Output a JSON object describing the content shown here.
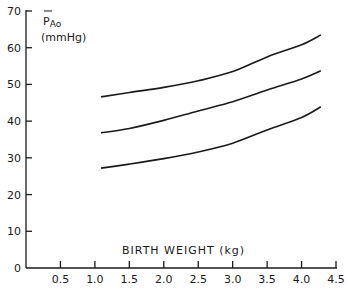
{
  "chart_data": {
    "type": "line",
    "title": "",
    "xlabel": "BIRTH WEIGHT (kg)",
    "ylabel": "P̄Ao (mmHg)",
    "ylabel_main": "P",
    "ylabel_sub": "Ao",
    "ylabel_units": "(mmHg)",
    "xlim": [
      0,
      4.5
    ],
    "ylim": [
      0,
      70
    ],
    "x_ticks": [
      0.5,
      1.0,
      1.5,
      2.0,
      2.5,
      3.0,
      3.5,
      4.0,
      4.5
    ],
    "x_tick_labels": [
      "0.5",
      "1.0",
      "1.5",
      "2.0",
      "2.5",
      "3.0",
      "3.5",
      "4.0",
      "4.5"
    ],
    "y_ticks": [
      0,
      10,
      20,
      30,
      40,
      50,
      60,
      70
    ],
    "y_tick_labels": [
      "0",
      "10",
      "20",
      "30",
      "40",
      "50",
      "60",
      "70"
    ],
    "grid": false,
    "legend": null,
    "x": [
      1.09,
      1.5,
      2.0,
      2.5,
      3.0,
      3.5,
      4.0,
      4.28
    ],
    "series": [
      {
        "name": "upper",
        "values": [
          46.6,
          47.8,
          49.2,
          51.0,
          53.5,
          57.5,
          60.8,
          63.5
        ]
      },
      {
        "name": "middle",
        "values": [
          36.8,
          38.0,
          40.2,
          42.8,
          45.3,
          48.5,
          51.5,
          53.7
        ]
      },
      {
        "name": "lower",
        "values": [
          27.2,
          28.3,
          29.8,
          31.6,
          34.0,
          37.6,
          41.0,
          43.9
        ]
      }
    ]
  }
}
